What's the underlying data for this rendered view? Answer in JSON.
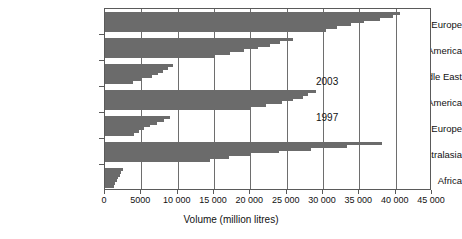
{
  "chart_data": {
    "type": "bar",
    "orientation": "horizontal",
    "title": "",
    "xlabel": "Volume (million litres)",
    "ylabel": "",
    "xlim": [
      0,
      45000
    ],
    "xticks": [
      0,
      5000,
      10000,
      15000,
      20000,
      25000,
      30000,
      35000,
      40000,
      45000
    ],
    "xticklabels": [
      "0",
      "5000",
      "10 000",
      "15 000",
      "20 000",
      "25 000",
      "30 000",
      "35 000",
      "40 000",
      "45 000"
    ],
    "grid": "vertical",
    "legend": "none",
    "bar_color": "#6b6b6b",
    "annotations": [
      {
        "text": "2003",
        "x": 30000,
        "note": "top bar of each group"
      },
      {
        "text": "1997",
        "x": 30000,
        "note": "bottom bar of each group"
      }
    ],
    "categories": [
      "West Europe",
      "North America",
      "Middle East",
      "Latin America",
      "East Europe",
      "Asia/Australasia",
      "Africa"
    ],
    "series": [
      {
        "name": "2003",
        "values": [
          40600,
          25900,
          9400,
          29100,
          9000,
          38100,
          2500
        ]
      },
      {
        "name": "2002",
        "values": [
          39600,
          24100,
          8700,
          28000,
          8100,
          33300,
          2250
        ]
      },
      {
        "name": "2001",
        "values": [
          37800,
          22700,
          8000,
          27200,
          7100,
          28300,
          2050
        ]
      },
      {
        "name": "2000",
        "values": [
          35600,
          21100,
          7300,
          25900,
          6200,
          24000,
          1800
        ]
      },
      {
        "name": "1999",
        "values": [
          33800,
          19100,
          6500,
          24300,
          5300,
          20100,
          1600
        ]
      },
      {
        "name": "1998",
        "values": [
          31900,
          17200,
          5100,
          22200,
          4700,
          17000,
          1400
        ]
      },
      {
        "name": "1997",
        "values": [
          30400,
          15100,
          3900,
          20000,
          4000,
          14500,
          1200
        ]
      }
    ]
  }
}
